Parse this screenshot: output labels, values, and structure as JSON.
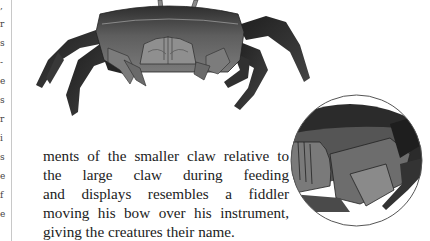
{
  "page": {
    "prev_column_fragments": [
      ",",
      "r",
      "s",
      "-",
      "e",
      "s",
      "r",
      "i",
      "s",
      "e",
      "f",
      "e"
    ],
    "illustration": {
      "subject": "fiddler crab",
      "inset_subject": "close-up of crab claws and mouthparts"
    },
    "body_text": {
      "lines": [
        "ments of the smaller claw relative to",
        "the large claw during feeding",
        "and displays resembles a fiddler",
        "moving his bow over his instrument,",
        "giving the creatures their name."
      ]
    }
  },
  "colors": {
    "background": "#ffffff",
    "text": "#222222",
    "crab_dark": "#2a2a2a",
    "crab_mid": "#6b6b6b",
    "crab_light": "#9a9a9a",
    "rule": "#c8c8c8"
  }
}
